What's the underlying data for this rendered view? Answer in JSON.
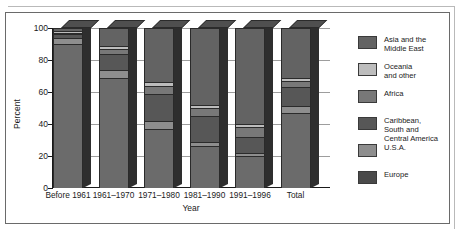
{
  "chart_data": {
    "type": "bar",
    "subtype": "stacked-3d-column",
    "title": "",
    "xlabel": "Year",
    "ylabel": "Percent",
    "ylim": [
      0,
      100
    ],
    "yticks": [
      0,
      20,
      40,
      60,
      80,
      100
    ],
    "grid": true,
    "legend_position": "right",
    "categories": [
      "Before 1961",
      "1961–1970",
      "1971–1980",
      "1981–1990",
      "1991–1996",
      "Total"
    ],
    "series": [
      {
        "name": "Europe",
        "color": "#6b6b6b",
        "values": [
          90,
          69,
          37,
          26,
          20,
          47
        ]
      },
      {
        "name": "U.S.A.",
        "color": "#8e8e8e",
        "values": [
          4,
          5,
          5,
          3,
          2,
          4
        ]
      },
      {
        "name": "Caribbean, South and Central America",
        "color": "#575757",
        "values": [
          2,
          10,
          17,
          16,
          10,
          12
        ]
      },
      {
        "name": "Africa",
        "color": "#787878",
        "values": [
          1,
          3,
          5,
          5,
          6,
          4
        ]
      },
      {
        "name": "Oceania and other",
        "color": "#bdbdbd",
        "values": [
          1,
          2,
          2,
          2,
          2,
          2
        ]
      },
      {
        "name": "Asia and the Middle East",
        "color": "#636363",
        "values": [
          2,
          11,
          34,
          48,
          60,
          31
        ]
      }
    ]
  },
  "axes": {
    "y_title": "Percent",
    "x_title": "Year",
    "y_tick_labels": [
      "100",
      "80",
      "60",
      "40",
      "20",
      "0"
    ],
    "x_tick_labels": [
      "Before 1961",
      "1961–1970",
      "1971–1980",
      "1981–1990",
      "1991–1996",
      "Total"
    ]
  },
  "legend": {
    "items": [
      {
        "label": "Asia and the\nMiddle East",
        "color": "#636363"
      },
      {
        "label": "Oceania\nand other",
        "color": "#bdbdbd"
      },
      {
        "label": "Africa",
        "color": "#787878"
      },
      {
        "label": "Caribbean,\nSouth and\nCentral America",
        "color": "#575757"
      },
      {
        "label": "U.S.A.",
        "color": "#8e8e8e"
      },
      {
        "label": "Europe",
        "color": "#4a4a4a"
      }
    ]
  }
}
